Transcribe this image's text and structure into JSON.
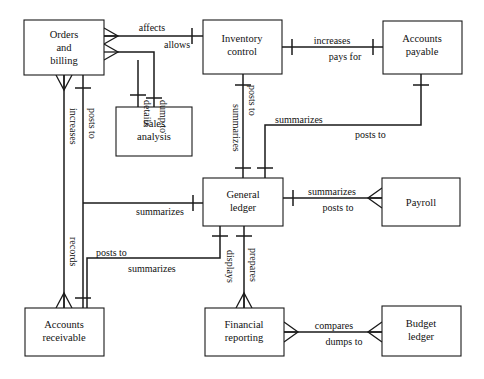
{
  "diagram": {
    "type": "entity-relationship-diagram",
    "notation": "crow's foot",
    "canvas": {
      "width": 484,
      "height": 379
    },
    "colors": {
      "line": "#1a1a1a",
      "fill": "#ffffff",
      "text": "#111111"
    },
    "entities": [
      {
        "id": "orders-and-billing",
        "lines": [
          "Orders",
          "and",
          "billing"
        ],
        "x": 24,
        "y": 20,
        "w": 80,
        "h": 55
      },
      {
        "id": "inventory-control",
        "lines": [
          "Inventory",
          "control"
        ],
        "x": 203,
        "y": 20,
        "w": 79,
        "h": 54
      },
      {
        "id": "accounts-payable",
        "lines": [
          "Accounts",
          "payable"
        ],
        "x": 383,
        "y": 21,
        "w": 79,
        "h": 53
      },
      {
        "id": "sales-analysis",
        "lines": [
          "Sales",
          "analysis"
        ],
        "x": 116,
        "y": 107,
        "w": 76,
        "h": 49
      },
      {
        "id": "general-ledger",
        "lines": [
          "General",
          "ledger"
        ],
        "x": 203,
        "y": 178,
        "w": 80,
        "h": 48
      },
      {
        "id": "payroll",
        "lines": [
          "Payroll"
        ],
        "x": 382,
        "y": 178,
        "w": 78,
        "h": 48
      },
      {
        "id": "accounts-receivable",
        "lines": [
          "Accounts",
          "receivable"
        ],
        "x": 25,
        "y": 308,
        "w": 79,
        "h": 48
      },
      {
        "id": "financial-reporting",
        "lines": [
          "Financial",
          "reporting"
        ],
        "x": 205,
        "y": 308,
        "w": 79,
        "h": 48
      },
      {
        "id": "budget-ledger",
        "lines": [
          "Budget",
          "ledger"
        ],
        "x": 382,
        "y": 306,
        "w": 79,
        "h": 50
      }
    ],
    "relationships": [
      {
        "id": "affects",
        "label": "affects",
        "from": "orders-and-billing",
        "to": "inventory-control"
      },
      {
        "id": "allows",
        "label": "allows",
        "from": "inventory-control",
        "to": "orders-and-billing"
      },
      {
        "id": "dump-to",
        "label": "dump to",
        "from": "orders-and-billing",
        "to": "sales-analysis"
      },
      {
        "id": "details",
        "label": "details",
        "from": "sales-analysis",
        "to": "orders-and-billing"
      },
      {
        "id": "increases-ar",
        "label": "increases",
        "from": "orders-and-billing",
        "to": "accounts-receivable"
      },
      {
        "id": "posts-to-ar",
        "label": "posts to",
        "from": "orders-and-billing",
        "to": "accounts-receivable"
      },
      {
        "id": "records",
        "label": "records",
        "from": "accounts-receivable",
        "to": "orders-and-billing"
      },
      {
        "id": "increases-ap",
        "label": "increases",
        "from": "inventory-control",
        "to": "accounts-payable"
      },
      {
        "id": "pays-for",
        "label": "pays for",
        "from": "accounts-payable",
        "to": "inventory-control"
      },
      {
        "id": "posts-to-gl-inv",
        "label": "posts to",
        "from": "inventory-control",
        "to": "general-ledger"
      },
      {
        "id": "summarizes-inv",
        "label": "summarizes",
        "from": "general-ledger",
        "to": "inventory-control"
      },
      {
        "id": "summarizes-ap",
        "label": "summarizes",
        "from": "general-ledger",
        "to": "accounts-payable"
      },
      {
        "id": "posts-to-gl-ap",
        "label": "posts to",
        "from": "accounts-payable",
        "to": "general-ledger"
      },
      {
        "id": "summarizes-ob",
        "label": "summarizes",
        "from": "general-ledger",
        "to": "orders-and-billing"
      },
      {
        "id": "summarizes-payroll",
        "label": "summarizes",
        "from": "general-ledger",
        "to": "payroll"
      },
      {
        "id": "posts-to-payroll",
        "label": "posts to",
        "from": "payroll",
        "to": "general-ledger"
      },
      {
        "id": "posts-to-gl-ar",
        "label": "posts to",
        "from": "accounts-receivable",
        "to": "general-ledger"
      },
      {
        "id": "summarizes-ar",
        "label": "summarizes",
        "from": "general-ledger",
        "to": "accounts-receivable"
      },
      {
        "id": "displays",
        "label": "displays",
        "from": "financial-reporting",
        "to": "general-ledger"
      },
      {
        "id": "prepares",
        "label": "prepares",
        "from": "general-ledger",
        "to": "financial-reporting"
      },
      {
        "id": "compares",
        "label": "compares",
        "from": "financial-reporting",
        "to": "budget-ledger"
      },
      {
        "id": "dumps-to",
        "label": "dumps to",
        "from": "budget-ledger",
        "to": "financial-reporting"
      }
    ],
    "labels": {
      "affects": "affects",
      "allows": "allows",
      "dump_to": "dump to",
      "details": "details",
      "increases_ar": "increases",
      "posts_to_ar": "posts to",
      "records": "records",
      "increases_ap": "increases",
      "pays_for": "pays for",
      "posts_to_gl_inv": "posts to",
      "summarizes_inv": "summarizes",
      "summarizes_ap": "summarizes",
      "posts_to_gl_ap": "posts to",
      "summarizes_ob": "summarizes",
      "summarizes_payroll": "summarizes",
      "posts_to_payroll": "posts to",
      "posts_to_gl_ar": "posts to",
      "summarizes_ar": "summarizes",
      "displays": "displays",
      "prepares": "prepares",
      "compares": "compares",
      "dumps_to": "dumps to"
    },
    "entity_text": {
      "orders_1": "Orders",
      "orders_2": "and",
      "orders_3": "billing",
      "inventory_1": "Inventory",
      "inventory_2": "control",
      "payable_1": "Accounts",
      "payable_2": "payable",
      "sales_1": "Sales",
      "sales_2": "analysis",
      "ledger_1": "General",
      "ledger_2": "ledger",
      "payroll_1": "Payroll",
      "receivable_1": "Accounts",
      "receivable_2": "receivable",
      "financial_1": "Financial",
      "financial_2": "reporting",
      "budget_1": "Budget",
      "budget_2": "ledger"
    }
  }
}
